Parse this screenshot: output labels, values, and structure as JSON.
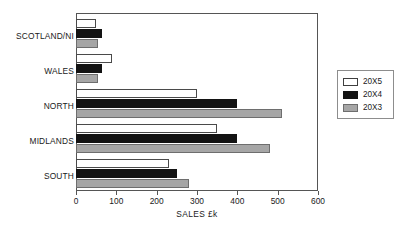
{
  "chart_data": {
    "type": "bar",
    "orientation": "horizontal",
    "title": "",
    "xlabel": "SALES £k",
    "ylabel": "",
    "categories": [
      "SOUTH",
      "MIDLANDS",
      "NORTH",
      "WALES",
      "SCOTLAND/NI"
    ],
    "series": [
      {
        "name": "20X5",
        "color": "#ffffff",
        "values": [
          230,
          350,
          300,
          90,
          50
        ]
      },
      {
        "name": "20X4",
        "color": "#131313",
        "values": [
          250,
          400,
          400,
          65,
          65
        ]
      },
      {
        "name": "20X3",
        "color": "#a6a6a6",
        "values": [
          280,
          480,
          510,
          55,
          55
        ]
      }
    ],
    "xlim": [
      0,
      600
    ],
    "xticks": [
      0,
      100,
      200,
      300,
      400,
      500,
      600
    ],
    "grid": false,
    "legend_position": "right-outside",
    "legend_entries": [
      "20X5",
      "20X4",
      "20X3"
    ]
  },
  "axis": {
    "tick_labels": [
      "0",
      "100",
      "200",
      "300",
      "400",
      "500",
      "600"
    ],
    "x_title": "SALES £k"
  },
  "categories": {
    "scotland": "SCOTLAND/NI",
    "wales": "WALES",
    "north": "NORTH",
    "midlands": "MIDLANDS",
    "south": "SOUTH"
  },
  "legend": {
    "rows": [
      {
        "label": "20X5"
      },
      {
        "label": "20X4"
      },
      {
        "label": "20X3"
      }
    ]
  }
}
